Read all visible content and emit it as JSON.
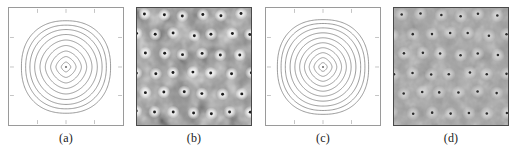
{
  "figure": {
    "background": "#ffffff",
    "panel_count": 4
  },
  "panels": [
    {
      "id": "a",
      "caption": "(a)",
      "type": "contour",
      "border_color": "#9a9a9a",
      "line_color": "#6f6f6f"
    },
    {
      "id": "b",
      "caption": "(b)",
      "type": "grayscale-image",
      "border_color": "#4a4a4a",
      "contrast": "high"
    },
    {
      "id": "c",
      "caption": "(c)",
      "type": "contour",
      "border_color": "#9a9a9a",
      "line_color": "#6f6f6f"
    },
    {
      "id": "d",
      "caption": "(d)",
      "type": "grayscale-image",
      "border_color": "#4a4a4a",
      "contrast": "low"
    }
  ],
  "chart_data": [
    {
      "type": "contour",
      "panel": "a",
      "title": "(a)",
      "xlabel": "",
      "ylabel": "",
      "xlim": [
        -1,
        1
      ],
      "ylim": [
        -1,
        1
      ],
      "grid": false,
      "legend": "none",
      "n_levels": 9,
      "levels": [
        0.1,
        0.2,
        0.3,
        0.4,
        0.5,
        0.6,
        0.7,
        0.8,
        0.9
      ],
      "shape": "superellipse-diamond",
      "exponent": 1.45,
      "radii": [
        0.09,
        0.19,
        0.29,
        0.39,
        0.49,
        0.59,
        0.68,
        0.76,
        0.84
      ],
      "center": [
        0.0,
        0.0
      ],
      "center_marker": true,
      "xticks": [
        -1,
        -0.5,
        0,
        0.5,
        1
      ],
      "yticks": [
        -1,
        -0.5,
        0,
        0.5,
        1
      ]
    },
    {
      "type": "heatmap",
      "panel": "b",
      "title": "(b)",
      "xlabel": "",
      "ylabel": "",
      "grid": false,
      "legend": "none",
      "colormap": "gray",
      "vmin": 0,
      "vmax": 1,
      "contrast": "high",
      "lattice": "staggered-hexagonal",
      "n_peaks": 36,
      "peak_rows": 6,
      "peak_cols": 6,
      "peak_marker": "dark-dot-with-white-halo",
      "row_offset_fraction": 0.5
    },
    {
      "type": "contour",
      "panel": "c",
      "title": "(c)",
      "xlabel": "",
      "ylabel": "",
      "xlim": [
        -1,
        1
      ],
      "ylim": [
        -1,
        1
      ],
      "grid": false,
      "legend": "none",
      "n_levels": 10,
      "levels": [
        0.05,
        0.14,
        0.23,
        0.32,
        0.41,
        0.5,
        0.59,
        0.68,
        0.77,
        0.86
      ],
      "shape": "superellipse-diamond",
      "exponent": 1.5,
      "radii": [
        0.08,
        0.17,
        0.26,
        0.35,
        0.44,
        0.53,
        0.62,
        0.71,
        0.79,
        0.86
      ],
      "center": [
        0.0,
        0.0
      ],
      "center_marker": true,
      "xticks": [
        -1,
        -0.5,
        0,
        0.5,
        1
      ],
      "yticks": [
        -1,
        -0.5,
        0,
        0.5,
        1
      ]
    },
    {
      "type": "heatmap",
      "panel": "d",
      "title": "(d)",
      "xlabel": "",
      "ylabel": "",
      "grid": false,
      "legend": "none",
      "colormap": "gray",
      "vmin": 0,
      "vmax": 1,
      "contrast": "low",
      "lattice": "staggered-hexagonal",
      "n_peaks": 36,
      "peak_rows": 6,
      "peak_cols": 6,
      "peak_marker": "dark-dot-with-light-halo",
      "row_offset_fraction": 0.5
    }
  ]
}
